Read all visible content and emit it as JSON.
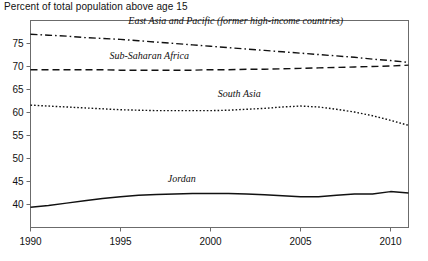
{
  "chart_data": {
    "type": "line",
    "title": "",
    "axis_note": "Percent of total population above age 15",
    "xlabel": "",
    "ylabel": "",
    "xlim": [
      1990,
      2011
    ],
    "ylim": [
      35,
      80
    ],
    "grid": false,
    "legend_position": "inline-labels",
    "xticks": [
      "1990",
      "1995",
      "2000",
      "2005",
      "2010"
    ],
    "xtick_values": [
      1990,
      1995,
      2000,
      2005,
      2010
    ],
    "yticks": [
      "40",
      "45",
      "50",
      "55",
      "60",
      "65",
      "70",
      "75"
    ],
    "ytick_values": [
      40,
      45,
      50,
      55,
      60,
      65,
      70,
      75
    ],
    "x": [
      1990,
      1991,
      1992,
      1993,
      1994,
      1995,
      1996,
      1997,
      1998,
      1999,
      2000,
      2001,
      2002,
      2003,
      2004,
      2005,
      2006,
      2007,
      2008,
      2009,
      2010,
      2011
    ],
    "series": [
      {
        "name": "East Asia and Pacific (former high-income countries)",
        "style": "dash-dot",
        "label_x": 2001.4,
        "label_y": 79.2,
        "values": [
          77.0,
          76.8,
          76.6,
          76.3,
          76.1,
          75.9,
          75.6,
          75.3,
          75.0,
          74.7,
          74.4,
          74.1,
          73.8,
          73.5,
          73.2,
          72.9,
          72.6,
          72.3,
          72.0,
          71.6,
          71.3,
          70.9
        ]
      },
      {
        "name": "Sub-Saharan Africa",
        "style": "dashed",
        "label_x": 1996.6,
        "label_y": 71.6,
        "values": [
          69.3,
          69.3,
          69.3,
          69.3,
          69.3,
          69.2,
          69.2,
          69.2,
          69.2,
          69.2,
          69.3,
          69.3,
          69.4,
          69.4,
          69.5,
          69.6,
          69.7,
          69.8,
          69.9,
          70.0,
          70.1,
          70.3
        ]
      },
      {
        "name": "South Asia",
        "style": "dotted",
        "label_x": 2001.6,
        "label_y": 63.4,
        "values": [
          61.6,
          61.4,
          61.2,
          61.0,
          60.8,
          60.6,
          60.5,
          60.4,
          60.4,
          60.4,
          60.4,
          60.5,
          60.7,
          60.9,
          61.2,
          61.4,
          61.2,
          60.7,
          60.1,
          59.3,
          58.3,
          57.2
        ]
      },
      {
        "name": "Jordan",
        "style": "solid",
        "label_x": 1998.4,
        "label_y": 45.0,
        "values": [
          39.4,
          39.8,
          40.3,
          40.8,
          41.3,
          41.7,
          42.0,
          42.2,
          42.3,
          42.4,
          42.4,
          42.4,
          42.3,
          42.1,
          41.9,
          41.7,
          41.7,
          42.0,
          42.3,
          42.3,
          42.8,
          42.5
        ]
      }
    ]
  }
}
